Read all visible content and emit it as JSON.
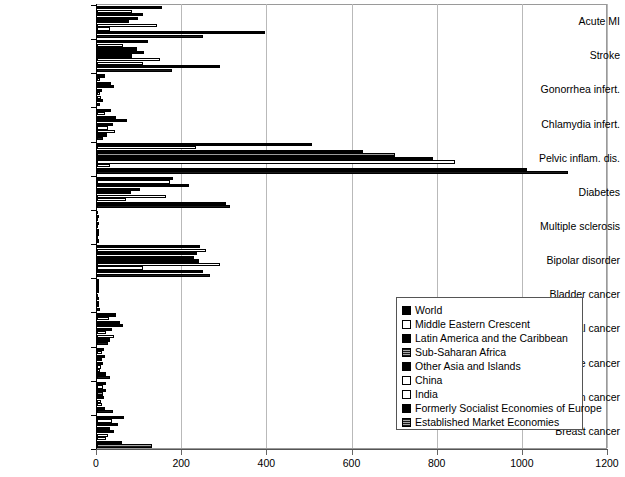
{
  "chart_data": {
    "type": "bar",
    "orientation": "horizontal",
    "title": "",
    "subtitle": "",
    "xlabel": "",
    "ylabel": "",
    "xlim": [
      0,
      1200
    ],
    "xticks": [
      0,
      200,
      400,
      600,
      800,
      1000,
      1200
    ],
    "xtick_labels": [
      "0",
      "200",
      "400",
      "600",
      "800",
      "1000",
      "1200"
    ],
    "grid": true,
    "grid_axis": "x",
    "legend_position": "center-right",
    "categories": [
      "Acute MI",
      "Stroke",
      "Gonorrhea infert.",
      "Chlamydia infert.",
      "Pelvic inflam. dis.",
      "Diabetes",
      "Multiple sclerosis",
      "Bipolar disorder",
      "Bladder cancer",
      "Cervical cancer",
      "Uterine cancer",
      "Ovarian cancer",
      "Breast cancer"
    ],
    "series": [
      {
        "name": "World",
        "color": "#000000",
        "fill": "solid-black",
        "values": [
          153,
          120,
          18,
          32,
          505,
          178,
          2,
          243,
          5,
          44,
          16,
          22,
          63
        ]
      },
      {
        "name": "Middle Eastern Crescent",
        "color": "#ffffff",
        "fill": "white-outline",
        "values": [
          82,
          60,
          7,
          18,
          232,
          172,
          1,
          255,
          3,
          28,
          11,
          13,
          36
        ]
      },
      {
        "name": "Latin America and the Caribbean",
        "color": "#000000",
        "fill": "solid-black",
        "values": [
          108,
          95,
          33,
          45,
          625,
          215,
          2,
          235,
          4,
          54,
          18,
          20,
          50
        ]
      },
      {
        "name": "Sub-Saharan Africa",
        "color": "#6d6d6d",
        "fill": "gray-hatch",
        "values": [
          96,
          110,
          40,
          70,
          700,
          100,
          1,
          228,
          2,
          60,
          12,
          14,
          30
        ]
      },
      {
        "name": "Other Asia and Islands",
        "color": "#000000",
        "fill": "solid-black",
        "values": [
          74,
          82,
          12,
          38,
          790,
          80,
          1,
          240,
          3,
          36,
          13,
          16,
          40
        ]
      },
      {
        "name": "China",
        "color": "#ffffff",
        "fill": "white-outline",
        "values": [
          140,
          148,
          8,
          25,
          840,
          162,
          1,
          290,
          2,
          20,
          9,
          10,
          27
        ]
      },
      {
        "name": "India",
        "color": "#ffffff",
        "fill": "white-outline",
        "values": [
          30,
          108,
          10,
          42,
          30,
          68,
          1,
          108,
          2,
          40,
          8,
          12,
          22
        ]
      },
      {
        "name": "Formerly Socialist Economies of Europe",
        "color": "#000000",
        "fill": "solid-black",
        "values": [
          395,
          290,
          13,
          23,
          1010,
          303,
          3,
          250,
          5,
          30,
          20,
          18,
          58
        ]
      },
      {
        "name": "Established Market Economies",
        "color": "#7a7a7a",
        "fill": "gray-hatch",
        "values": [
          250,
          175,
          8,
          14,
          1105,
          312,
          4,
          265,
          6,
          25,
          30,
          38,
          130
        ]
      }
    ]
  },
  "legend": {
    "entries": [
      {
        "label": "World",
        "fill": "solid-black"
      },
      {
        "label": "Middle Eastern Crescent",
        "fill": "white-outline"
      },
      {
        "label": "Latin America and the Caribbean",
        "fill": "solid-black"
      },
      {
        "label": "Sub-Saharan Africa",
        "fill": "gray-hatch"
      },
      {
        "label": "Other Asia and Islands",
        "fill": "solid-black"
      },
      {
        "label": "China",
        "fill": "white-outline"
      },
      {
        "label": "India",
        "fill": "white-outline"
      },
      {
        "label": "Formerly Socialist Economies of Europe",
        "fill": "solid-black"
      },
      {
        "label": "Established Market Economies",
        "fill": "gray-hatch"
      }
    ]
  },
  "colors": {
    "black": "#000000",
    "white": "#ffffff",
    "gray": "#7a7a7a",
    "gridline": "#b9b9b9",
    "frame": "#9a9a9a"
  }
}
